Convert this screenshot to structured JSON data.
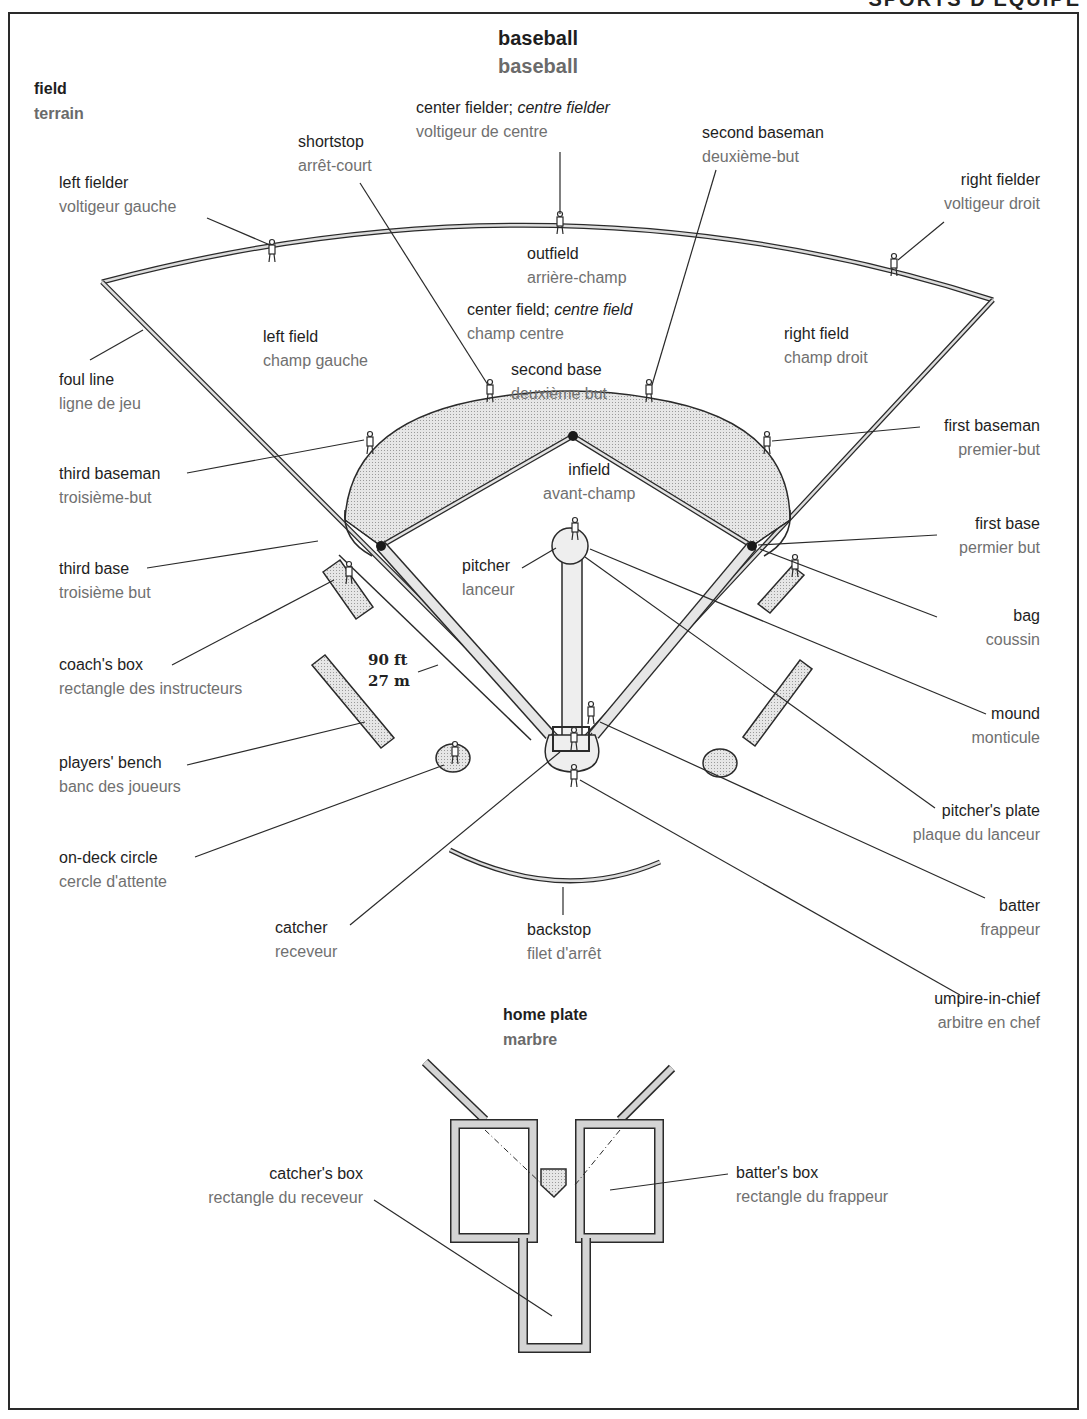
{
  "header": {
    "section_title_partial": "SPORTS D'ÉQUIPE"
  },
  "title": {
    "en": "baseball",
    "fr": "baseball"
  },
  "sections": {
    "field": {
      "en": "field",
      "fr": "terrain"
    },
    "home_plate": {
      "en": "home plate",
      "fr": "marbre"
    }
  },
  "dimension": {
    "feet": "90 ft",
    "meters": "27 m"
  },
  "labels": {
    "center_fielder": {
      "en": "center fielder;",
      "en_alt": "centre fielder",
      "fr": "voltigeur de centre"
    },
    "shortstop": {
      "en": "shortstop",
      "fr": "arrêt-court"
    },
    "second_baseman": {
      "en": "second baseman",
      "fr": "deuxième-but"
    },
    "left_fielder": {
      "en": "left fielder",
      "fr": "voltigeur gauche"
    },
    "right_fielder": {
      "en": "right fielder",
      "fr": "voltigeur droit"
    },
    "outfield": {
      "en": "outfield",
      "fr": "arrière-champ"
    },
    "center_field": {
      "en": "center field;",
      "en_alt": "centre field",
      "fr": "champ centre"
    },
    "left_field": {
      "en": "left field",
      "fr": "champ gauche"
    },
    "right_field": {
      "en": "right field",
      "fr": "champ droit"
    },
    "foul_line": {
      "en": "foul line",
      "fr": "ligne de jeu"
    },
    "second_base": {
      "en": "second base",
      "fr": "deuxième but"
    },
    "first_baseman": {
      "en": "first baseman",
      "fr": "premier-but"
    },
    "third_baseman": {
      "en": "third baseman",
      "fr": "troisième-but"
    },
    "infield": {
      "en": "infield",
      "fr": "avant-champ"
    },
    "first_base": {
      "en": "first base",
      "fr": "permier but"
    },
    "third_base": {
      "en": "third base",
      "fr": "troisième but"
    },
    "pitcher": {
      "en": "pitcher",
      "fr": "lanceur"
    },
    "bag": {
      "en": "bag",
      "fr": "coussin"
    },
    "coachs_box": {
      "en": "coach's box",
      "fr": "rectangle des instructeurs"
    },
    "mound": {
      "en": "mound",
      "fr": "monticule"
    },
    "players_bench": {
      "en": "players' bench",
      "fr": "banc des joueurs"
    },
    "pitchers_plate": {
      "en": "pitcher's plate",
      "fr": "plaque du lanceur"
    },
    "on_deck_circle": {
      "en": "on-deck circle",
      "fr": "cercle d'attente"
    },
    "batter": {
      "en": "batter",
      "fr": "frappeur"
    },
    "catcher": {
      "en": "catcher",
      "fr": "receveur"
    },
    "backstop": {
      "en": "backstop",
      "fr": "filet d'arrêt"
    },
    "umpire_in_chief": {
      "en": "umpire-in-chief",
      "fr": "arbitre en chef"
    },
    "catchers_box": {
      "en": "catcher's box",
      "fr": "rectangle du receveur"
    },
    "batters_box": {
      "en": "batter's box",
      "fr": "rectangle du frappeur"
    }
  },
  "colors": {
    "ink": "#1e1e1e",
    "french_text": "#707070",
    "fill_stipple": "#d4d4d4",
    "line": "#2a2a2a"
  }
}
